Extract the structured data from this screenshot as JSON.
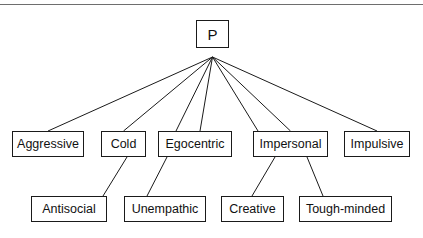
{
  "diagram": {
    "type": "tree",
    "colors": {
      "box_border": "#1a1a1a",
      "edge": "#1a1a1a",
      "background": "#ffffff",
      "rule": "#6e6e6e"
    },
    "top_rule": {
      "visible": true
    },
    "root": {
      "id": "P",
      "label": "P",
      "box": {
        "x": 196,
        "y": 20,
        "w": 33,
        "h": 28
      }
    },
    "fan_origin": {
      "x": 212.5,
      "y": 57
    },
    "mid_nodes": [
      {
        "id": "aggressive",
        "label": "Aggressive",
        "box": {
          "x": 12,
          "y": 131,
          "w": 72,
          "h": 26
        }
      },
      {
        "id": "cold",
        "label": "Cold",
        "box": {
          "x": 101,
          "y": 131,
          "w": 45,
          "h": 26
        }
      },
      {
        "id": "egocentric",
        "label": "Egocentric",
        "box": {
          "x": 158,
          "y": 131,
          "w": 74,
          "h": 26
        }
      },
      {
        "id": "impersonal",
        "label": "Impersonal",
        "box": {
          "x": 253,
          "y": 131,
          "w": 75,
          "h": 26
        }
      },
      {
        "id": "impulsive",
        "label": "Impulsive",
        "box": {
          "x": 344,
          "y": 131,
          "w": 66,
          "h": 26
        }
      }
    ],
    "leaf_nodes": [
      {
        "id": "antisocial",
        "label": "Antisocial",
        "box": {
          "x": 31,
          "y": 196,
          "w": 76,
          "h": 26
        }
      },
      {
        "id": "unempathic",
        "label": "Unempathic",
        "box": {
          "x": 124,
          "y": 196,
          "w": 82,
          "h": 26
        }
      },
      {
        "id": "creative",
        "label": "Creative",
        "box": {
          "x": 221,
          "y": 196,
          "w": 63,
          "h": 26
        }
      },
      {
        "id": "toughminded",
        "label": "Tough-minded",
        "box": {
          "x": 299,
          "y": 196,
          "w": 93,
          "h": 26
        }
      }
    ],
    "edges_root_to_mid": [
      {
        "from": "P",
        "to": "aggressive",
        "x1": 212.5,
        "y1": 57,
        "x2": 48,
        "y2": 131
      },
      {
        "from": "P",
        "to": "cold",
        "x1": 212.5,
        "y1": 57,
        "x2": 123.5,
        "y2": 131
      },
      {
        "from": "P",
        "to": "egocentric",
        "x1": 212.5,
        "y1": 57,
        "x2": 176,
        "y2": 131
      },
      {
        "from": "P",
        "to": "egocentric2",
        "x1": 212.5,
        "y1": 57,
        "x2": 200,
        "y2": 131
      },
      {
        "from": "P",
        "to": "impersonal",
        "x1": 212.5,
        "y1": 57,
        "x2": 258,
        "y2": 131
      },
      {
        "from": "P",
        "to": "impersonal2",
        "x1": 212.5,
        "y1": 57,
        "x2": 290.5,
        "y2": 131
      },
      {
        "from": "P",
        "to": "impulsive",
        "x1": 212.5,
        "y1": 57,
        "x2": 377,
        "y2": 131
      }
    ],
    "edges_mid_to_leaf": [
      {
        "from": "cold",
        "to": "antisocial",
        "x1": 127,
        "y1": 157,
        "x2": 103,
        "y2": 196
      },
      {
        "from": "egocentric",
        "to": "unempathic",
        "x1": 167,
        "y1": 157,
        "x2": 147,
        "y2": 196
      },
      {
        "from": "impersonal",
        "to": "creative",
        "x1": 275,
        "y1": 157,
        "x2": 252,
        "y2": 196
      },
      {
        "from": "impersonal",
        "to": "toughminded",
        "x1": 307,
        "y1": 157,
        "x2": 323,
        "y2": 196
      }
    ]
  }
}
